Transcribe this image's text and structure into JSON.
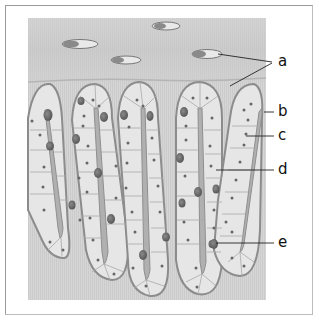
{
  "figure": {
    "labels": [
      {
        "id": "a",
        "text": "a"
      },
      {
        "id": "b",
        "text": "b"
      },
      {
        "id": "c",
        "text": "c"
      },
      {
        "id": "d",
        "text": "d"
      },
      {
        "id": "e",
        "text": "e"
      }
    ]
  },
  "colors": {
    "background": "#ffffff",
    "tissue": "#d8d8d8",
    "stroma": "#cdcdcd",
    "band": "#c2c2c2",
    "gland_fill": "#e6e6e6",
    "gland_outline": "#8c8c8c",
    "lumen": "#a9a9a9",
    "nucleus": "#6a6a6a",
    "frame": "#9a9a9a",
    "text": "#111111"
  }
}
